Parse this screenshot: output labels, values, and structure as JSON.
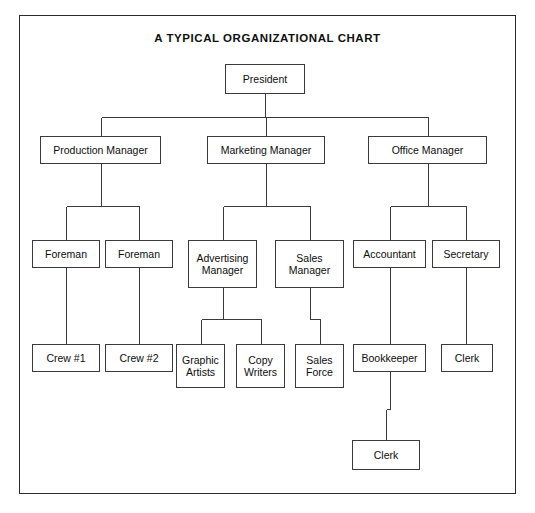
{
  "document": {
    "title": "A TYPICAL ORGANIZATIONAL CHART",
    "background_color": "#ffffff",
    "frame_color": "#2b2b2b",
    "box_border_color": "#3a3a3a",
    "connector_color": "#3a3a3a",
    "text_color": "#0d0d0d"
  },
  "chart_data": {
    "type": "diagram",
    "subtype": "organizational-chart",
    "title": "A TYPICAL ORGANIZATIONAL CHART",
    "orientation": "top-down",
    "levels": 5,
    "nodes": [
      {
        "id": "president",
        "label": "President",
        "level": 0,
        "parent": null,
        "x": 225,
        "y": 64,
        "w": 80,
        "h": 30
      },
      {
        "id": "production-manager",
        "label": "Production Manager",
        "level": 1,
        "parent": "president",
        "x": 40,
        "y": 136,
        "w": 121,
        "h": 28
      },
      {
        "id": "marketing-manager",
        "label": "Marketing Manager",
        "level": 1,
        "parent": "president",
        "x": 207,
        "y": 136,
        "w": 118,
        "h": 28
      },
      {
        "id": "office-manager",
        "label": "Office Manager",
        "level": 1,
        "parent": "president",
        "x": 368,
        "y": 136,
        "w": 119,
        "h": 28
      },
      {
        "id": "foreman-1",
        "label": "Foreman",
        "level": 2,
        "parent": "production-manager",
        "x": 32,
        "y": 240,
        "w": 68,
        "h": 28
      },
      {
        "id": "foreman-2",
        "label": "Foreman",
        "level": 2,
        "parent": "production-manager",
        "x": 105,
        "y": 240,
        "w": 68,
        "h": 28
      },
      {
        "id": "advertising-manager",
        "label": "Advertising\nManager",
        "level": 2,
        "parent": "marketing-manager",
        "x": 188,
        "y": 240,
        "w": 69,
        "h": 48
      },
      {
        "id": "sales-manager",
        "label": "Sales\nManager",
        "level": 2,
        "parent": "marketing-manager",
        "x": 275,
        "y": 240,
        "w": 69,
        "h": 48
      },
      {
        "id": "accountant",
        "label": "Accountant",
        "level": 2,
        "parent": "office-manager",
        "x": 353,
        "y": 240,
        "w": 73,
        "h": 28
      },
      {
        "id": "secretary",
        "label": "Secretary",
        "level": 2,
        "parent": "office-manager",
        "x": 432,
        "y": 240,
        "w": 68,
        "h": 28
      },
      {
        "id": "crew-1",
        "label": "Crew #1",
        "level": 3,
        "parent": "foreman-1",
        "x": 32,
        "y": 344,
        "w": 68,
        "h": 28
      },
      {
        "id": "crew-2",
        "label": "Crew #2",
        "level": 3,
        "parent": "foreman-2",
        "x": 105,
        "y": 344,
        "w": 68,
        "h": 28
      },
      {
        "id": "graphic-artists",
        "label": "Graphic\nArtists",
        "level": 3,
        "parent": "advertising-manager",
        "x": 176,
        "y": 344,
        "w": 49,
        "h": 44
      },
      {
        "id": "copy-writers",
        "label": "Copy\nWriters",
        "level": 3,
        "parent": "advertising-manager",
        "x": 236,
        "y": 344,
        "w": 49,
        "h": 44
      },
      {
        "id": "sales-force",
        "label": "Sales\nForce",
        "level": 3,
        "parent": "sales-manager",
        "x": 295,
        "y": 344,
        "w": 49,
        "h": 44
      },
      {
        "id": "bookkeeper",
        "label": "Bookkeeper",
        "level": 3,
        "parent": "accountant",
        "x": 353,
        "y": 344,
        "w": 73,
        "h": 28
      },
      {
        "id": "clerk-secretary",
        "label": "Clerk",
        "level": 3,
        "parent": "secretary",
        "x": 441,
        "y": 344,
        "w": 52,
        "h": 28
      },
      {
        "id": "clerk-bookkeeper",
        "label": "Clerk",
        "level": 4,
        "parent": "bookkeeper",
        "x": 352,
        "y": 440,
        "w": 68,
        "h": 30
      }
    ],
    "edges": [
      {
        "from": "president",
        "to": "production-manager"
      },
      {
        "from": "president",
        "to": "marketing-manager"
      },
      {
        "from": "president",
        "to": "office-manager"
      },
      {
        "from": "production-manager",
        "to": "foreman-1"
      },
      {
        "from": "production-manager",
        "to": "foreman-2"
      },
      {
        "from": "marketing-manager",
        "to": "advertising-manager"
      },
      {
        "from": "marketing-manager",
        "to": "sales-manager"
      },
      {
        "from": "office-manager",
        "to": "accountant"
      },
      {
        "from": "office-manager",
        "to": "secretary"
      },
      {
        "from": "foreman-1",
        "to": "crew-1"
      },
      {
        "from": "foreman-2",
        "to": "crew-2"
      },
      {
        "from": "advertising-manager",
        "to": "graphic-artists"
      },
      {
        "from": "advertising-manager",
        "to": "copy-writers"
      },
      {
        "from": "sales-manager",
        "to": "sales-force"
      },
      {
        "from": "accountant",
        "to": "bookkeeper"
      },
      {
        "from": "secretary",
        "to": "clerk-secretary"
      },
      {
        "from": "bookkeeper",
        "to": "clerk-bookkeeper"
      }
    ]
  }
}
